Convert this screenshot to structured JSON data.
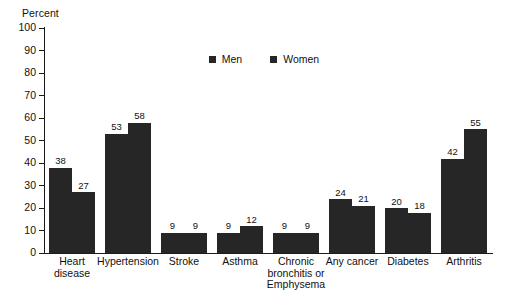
{
  "chart_data": {
    "type": "bar",
    "title": "",
    "xlabel": "",
    "ylabel": "Percent",
    "ylim": [
      0,
      100
    ],
    "ytick_step": 10,
    "yticks": [
      100,
      90,
      80,
      70,
      60,
      50,
      40,
      30,
      20,
      10,
      0
    ],
    "grid": false,
    "legend_position": "top-center",
    "bar_color": "#262626",
    "axis_color": "#1a1a1a",
    "categories": [
      "Heart disease",
      "Hypertension",
      "Stroke",
      "Asthma",
      "Chronic bronchitis or Emphysema",
      "Any cancer",
      "Diabetes",
      "Arthritis"
    ],
    "category_lines": [
      [
        "Heart",
        "disease"
      ],
      [
        "Hypertension"
      ],
      [
        "Stroke"
      ],
      [
        "Asthma"
      ],
      [
        "Chronic",
        "bronchitis or",
        "Emphysema"
      ],
      [
        "Any cancer"
      ],
      [
        "Diabetes"
      ],
      [
        "Arthritis"
      ]
    ],
    "series": [
      {
        "name": "Men",
        "values": [
          38,
          53,
          9,
          9,
          9,
          24,
          20,
          42
        ]
      },
      {
        "name": "Women",
        "values": [
          27,
          58,
          9,
          12,
          9,
          21,
          18,
          55
        ]
      }
    ]
  },
  "legend": {
    "items": [
      {
        "label": "Men"
      },
      {
        "label": "Women"
      }
    ]
  },
  "footnote": {
    "text": ""
  }
}
